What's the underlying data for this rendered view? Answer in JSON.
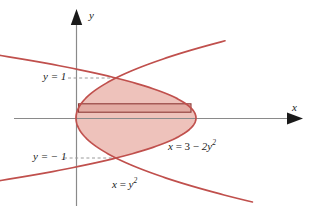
{
  "figure": {
    "axis_labels": {
      "x": "x",
      "y": "y"
    },
    "gridline_labels": {
      "upper": "y = 1",
      "lower": "y = − 1"
    },
    "curve_labels": {
      "right_parabola": {
        "lhs": "x",
        "eq": " = ",
        "rhs_a": "3 ",
        "rhs_op": "− ",
        "rhs_b": "2y",
        "exp": "2"
      },
      "left_parabola": {
        "lhs": "x",
        "eq": " = ",
        "rhs": "y",
        "exp": "2"
      }
    },
    "colors": {
      "curve_stroke": "#c0504d",
      "region_fill": "#eec2bb",
      "axis": "#808080",
      "arrow": "#1a1a1a",
      "dash": "#9a9a9a",
      "text": "#1a1a1a"
    }
  },
  "chart_data": {
    "type": "line",
    "xlabel": "x",
    "ylabel": "y",
    "xlim": [
      -2.2,
      5.6
    ],
    "ylim": [
      -2.65,
      2.95
    ],
    "grid": false,
    "legend": "none",
    "origin_px": [
      76,
      118
    ],
    "scale_px_per_unit": 40,
    "series": [
      {
        "name": "x = y^2",
        "equation": "x = y^2",
        "label": "x = y²",
        "color": "#c0504d",
        "y_range": [
          -2.1,
          1.93
        ],
        "points": [
          [
            4.41,
            -2.1
          ],
          [
            2.89,
            -1.7
          ],
          [
            1.69,
            -1.3
          ],
          [
            1.0,
            -1.0
          ],
          [
            0.49,
            -0.7
          ],
          [
            0.16,
            -0.4
          ],
          [
            0.0,
            0.0
          ],
          [
            0.16,
            0.4
          ],
          [
            0.49,
            0.7
          ],
          [
            1.0,
            1.0
          ],
          [
            1.69,
            1.3
          ],
          [
            2.89,
            1.7
          ],
          [
            3.72,
            1.93
          ]
        ]
      },
      {
        "name": "x = 3 - 2y^2",
        "equation": "x = 3 - 2y^2",
        "label": "x = 3 − 2y²",
        "color": "#c0504d",
        "y_range": [
          -2.55,
          2.55
        ],
        "points": [
          [
            -10.0,
            -2.55
          ],
          [
            -3.5,
            -1.8
          ],
          [
            -1.0,
            -1.414
          ],
          [
            1.0,
            -1.0
          ],
          [
            2.0,
            -0.707
          ],
          [
            2.5,
            -0.5
          ],
          [
            3.0,
            0.0
          ],
          [
            2.5,
            0.5
          ],
          [
            2.0,
            0.707
          ],
          [
            1.0,
            1.0
          ],
          [
            -1.0,
            1.414
          ],
          [
            -3.5,
            1.8
          ],
          [
            -10.0,
            2.55
          ]
        ]
      }
    ],
    "intersections": [
      {
        "x": 1,
        "y": 1,
        "label": "y = 1"
      },
      {
        "x": 1,
        "y": -1,
        "label": "y = − 1"
      }
    ],
    "shaded_region": {
      "description": "Area between x = y^2 (left boundary) and x = 3 - 2y^2 (right boundary) for -1 <= y <= 1",
      "fill": "#eec2bb",
      "y_from": -1,
      "y_to": 1
    },
    "sample_strip": {
      "description": "Representative horizontal rectangle from x = y^2 to x = 3 - 2y^2",
      "y": 0.25,
      "x_left": 0.0625,
      "x_right": 2.875
    },
    "annotations": [
      {
        "text": "y = 1",
        "x": -0.85,
        "y": 1.05
      },
      {
        "text": "y = − 1",
        "x": -1.1,
        "y": -0.95
      },
      {
        "text": "x = 3 − 2y²",
        "x": 2.35,
        "y": -0.62
      },
      {
        "text": "x = y²",
        "x": 0.95,
        "y": -1.6
      }
    ]
  }
}
